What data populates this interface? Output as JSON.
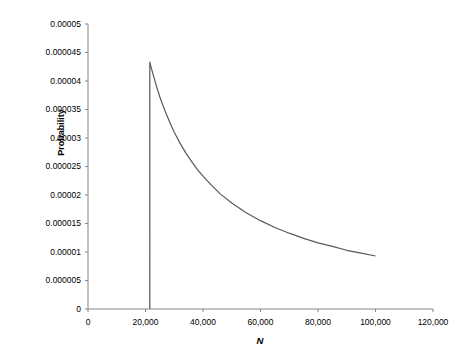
{
  "chart_data": {
    "type": "line",
    "title": "",
    "xlabel": "N",
    "ylabel": "Probability",
    "xlim": [
      0,
      120000
    ],
    "ylim": [
      0,
      5e-05
    ],
    "grid": false,
    "legend": "none",
    "xticks": [
      0,
      20000,
      40000,
      60000,
      80000,
      100000,
      120000
    ],
    "xtick_labels": [
      "0",
      "20,000",
      "40,000",
      "60,000",
      "80,000",
      "100,000",
      "120,000"
    ],
    "yticks": [
      0,
      5e-06,
      1e-05,
      1.5e-05,
      2e-05,
      2.5e-05,
      3e-05,
      3.5e-05,
      4e-05,
      4.5e-05,
      5e-05
    ],
    "ytick_labels": [
      "0",
      "0.000005",
      "0.00001",
      "0.000015",
      "0.00002",
      "0.000025",
      "0.00003",
      "0.000035",
      "0.00004",
      "0.000045",
      "0.00005"
    ],
    "line_color": "#595959",
    "axis_color": "#868686",
    "series": [
      {
        "name": "Probability",
        "x": [
          21500,
          21500,
          22000,
          23000,
          24000,
          25000,
          26000,
          27000,
          28000,
          29000,
          30000,
          32000,
          34000,
          36000,
          38000,
          40000,
          43000,
          46000,
          50000,
          55000,
          60000,
          65000,
          70000,
          75000,
          80000,
          85000,
          90000,
          95000,
          100000
        ],
        "y": [
          0,
          4.33e-05,
          4.23e-05,
          4.05e-05,
          3.88e-05,
          3.72e-05,
          3.58e-05,
          3.45e-05,
          3.33e-05,
          3.21e-05,
          3.1e-05,
          2.91e-05,
          2.74e-05,
          2.59e-05,
          2.45e-05,
          2.33e-05,
          2.17e-05,
          2.02e-05,
          1.86e-05,
          1.69e-05,
          1.55e-05,
          1.43e-05,
          1.33e-05,
          1.24e-05,
          1.16e-05,
          1.1e-05,
          1.03e-05,
          9.8e-06,
          9.3e-06
        ]
      }
    ],
    "annotations": [
      {
        "name": "peak",
        "x": 21500,
        "y": 4.33e-05,
        "note": "sharp vertical rise to mode"
      },
      {
        "name": "endpoint",
        "x": 100000,
        "y": 9.3e-06,
        "note": "curve terminates"
      }
    ]
  }
}
